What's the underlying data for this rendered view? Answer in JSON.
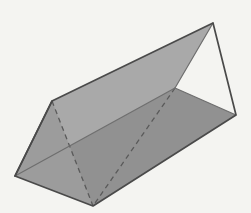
{
  "figure": {
    "name": "triangular-prism",
    "background_color": "#f4f4f1",
    "width": 251,
    "height": 213,
    "stroke_color": "#4a4a4a",
    "stroke_width": 1.6,
    "hidden_stroke_color": "#5a5a5a",
    "hidden_dash_pattern": "5,4",
    "vertices": {
      "near_apex_left": {
        "label": "A",
        "x": 52,
        "y": 101
      },
      "near_base_left": {
        "label": "B",
        "x": 15,
        "y": 176
      },
      "near_base_front": {
        "label": "C",
        "x": 93,
        "y": 206
      },
      "far_apex_right": {
        "label": "D",
        "x": 213,
        "y": 23
      },
      "far_base_right": {
        "label": "E",
        "x": 236,
        "y": 115
      },
      "far_base_inner": {
        "label": "F",
        "x": 175,
        "y": 88
      }
    },
    "faces": [
      {
        "name": "top-back-face",
        "fill": "#a9a9a9",
        "points": "52,101 213,23 175,88 15,176"
      },
      {
        "name": "front-lower-face",
        "fill": "#919191",
        "points": "15,176 175,88 236,115 93,206"
      },
      {
        "name": "left-triangular-end-face",
        "fill": "#9c9c9c",
        "points": "52,101 15,176 93,206"
      }
    ],
    "visible_edges": [
      {
        "name": "edge-top-ridge",
        "points": "52,101 213,23"
      },
      {
        "name": "edge-right-upper",
        "points": "213,23 236,115"
      },
      {
        "name": "edge-right-lower",
        "points": "236,115 93,206"
      },
      {
        "name": "edge-bottom-front",
        "points": "93,206 15,176"
      },
      {
        "name": "edge-left-upper",
        "points": "15,176 52,101"
      },
      {
        "name": "edge-end-cap-left",
        "points": "52,101 15,176"
      },
      {
        "name": "edge-ridge-to-inner",
        "points": "175,88 236,115"
      },
      {
        "name": "edge-inner-to-base",
        "points": "15,176 175,88"
      },
      {
        "name": "edge-apex-to-inner",
        "points": "213,23 175,88"
      }
    ],
    "hidden_edges": [
      {
        "name": "hidden-edge-apex-to-front-base",
        "points": "52,101 93,206"
      },
      {
        "name": "hidden-edge-inner-ridge-long",
        "points": "175,88 93,206"
      }
    ],
    "geometry_type": "triangular-prism",
    "face_count_visible": 3,
    "vertex_count": 6,
    "edge_count": 9
  }
}
